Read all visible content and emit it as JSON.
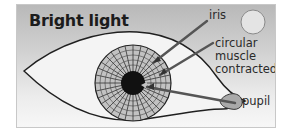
{
  "diagram": {
    "title": "Bright light",
    "labels": {
      "iris": "iris",
      "circular_muscle": [
        "circular",
        "muscle",
        "contracted"
      ],
      "pupil": "pupil"
    },
    "icons": {
      "sun": "light-source-circle"
    },
    "colors": {
      "background_top": "#b9b9b9",
      "background_bottom": "#f7f7f7",
      "pupil": "#111111",
      "iris_fill": "#bdbdbd",
      "pointer": "#555555",
      "sun_fill": "#e2e2e2"
    }
  }
}
